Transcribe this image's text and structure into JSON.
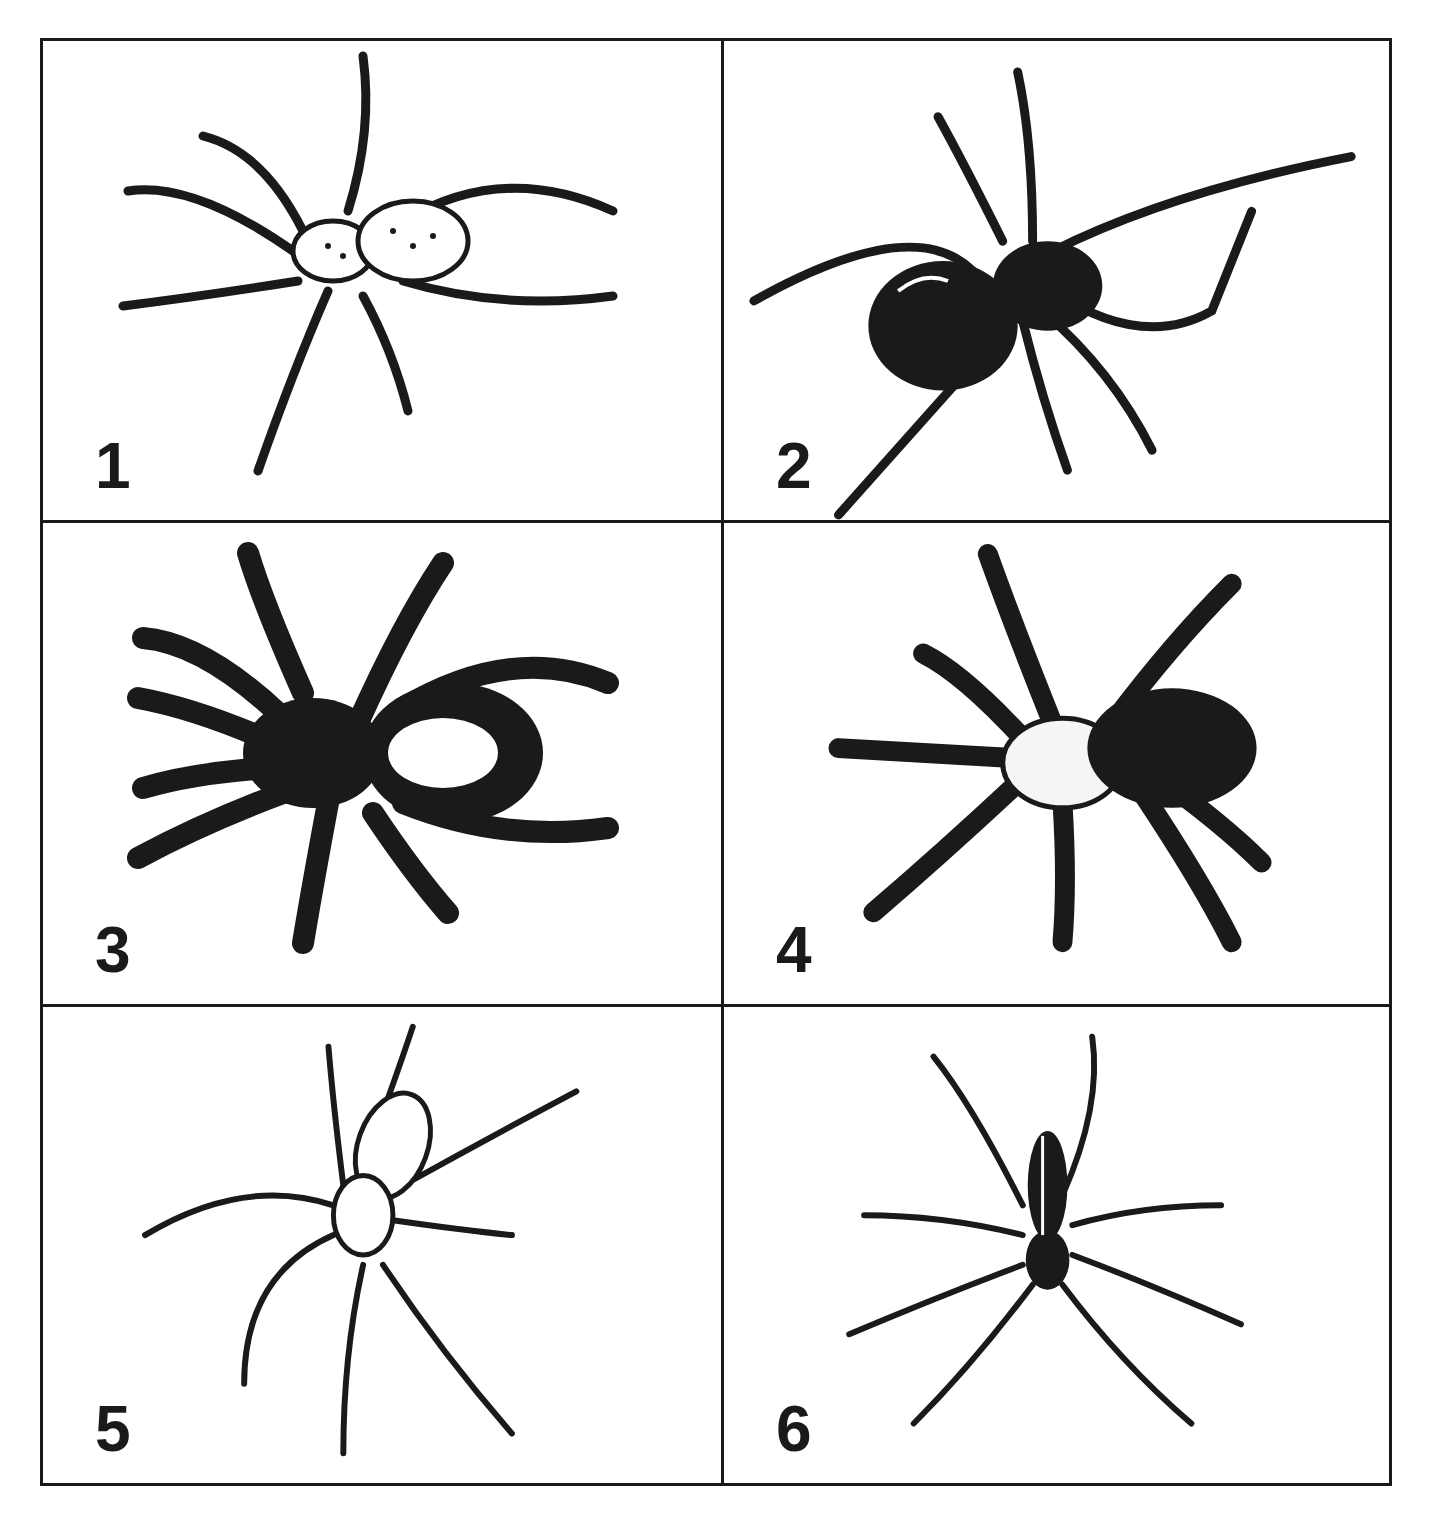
{
  "figure": {
    "layout": {
      "rows": 3,
      "columns": 2
    },
    "panels": [
      {
        "label": "1",
        "description": "stippled spider with patterned legs and oval abdomen"
      },
      {
        "label": "2",
        "description": "solid black spider with glossy round abdomen (widow-like)"
      },
      {
        "label": "3",
        "description": "dark spider with light patch on abdomen, banded legs"
      },
      {
        "label": "4",
        "description": "very hairy hatched spider with pale cephalothorax"
      },
      {
        "label": "5",
        "description": "long-legged spider with patterned elongated abdomen"
      },
      {
        "label": "6",
        "description": "slender long-legged spider with dark elongated body and pale stripe"
      }
    ]
  },
  "colors": {
    "ink": "#1a1a1a",
    "background": "#ffffff"
  }
}
